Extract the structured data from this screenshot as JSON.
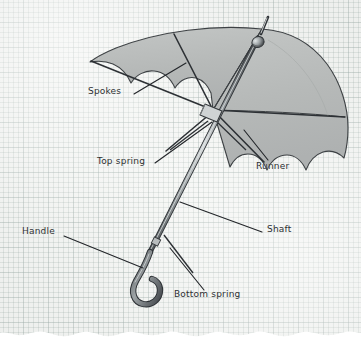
{
  "diagram": {
    "background": "graph-paper",
    "background_color": "#f6f7f5",
    "grid_color": "#a8b4b2",
    "canopy_fill": "#b9bcbb",
    "canopy_stroke": "#3d4144",
    "metal_color": "#6f7376",
    "line_color": "#23262a",
    "label_color": "#2c2f31"
  },
  "labels": [
    {
      "id": "spokes",
      "text": "Spokes",
      "x": 88,
      "y": 93
    },
    {
      "id": "top-spring",
      "text": "Top spring",
      "x": 97,
      "y": 163
    },
    {
      "id": "runner",
      "text": "Runner",
      "x": 256,
      "y": 168
    },
    {
      "id": "shaft",
      "text": "Shaft",
      "x": 267,
      "y": 231
    },
    {
      "id": "handle",
      "text": "Handle",
      "x": 22,
      "y": 233
    },
    {
      "id": "bottom-spring",
      "text": "Bottom spring",
      "x": 174,
      "y": 296
    }
  ],
  "leader_lines": [
    {
      "id": "spokes-leader",
      "x1": 134,
      "y1": 94,
      "x2": 186,
      "y2": 63
    },
    {
      "id": "top-spring-leader",
      "x1": 155,
      "y1": 163,
      "x2": 212,
      "y2": 122
    },
    {
      "id": "runner-leader",
      "x1": 268,
      "y1": 160,
      "x2": 244,
      "y2": 130
    },
    {
      "id": "shaft-leader",
      "x1": 262,
      "y1": 232,
      "x2": 180,
      "y2": 202
    },
    {
      "id": "handle-leader",
      "x1": 64,
      "y1": 236,
      "x2": 143,
      "y2": 268
    },
    {
      "id": "bottom-spring-leader",
      "x1": 204,
      "y1": 290,
      "x2": 170,
      "y2": 248
    }
  ],
  "parts": [
    {
      "id": "canopy",
      "name": "umbrella-canopy"
    },
    {
      "id": "ferrule",
      "name": "umbrella-tip-ferrule"
    },
    {
      "id": "shaft",
      "name": "umbrella-shaft"
    },
    {
      "id": "runner",
      "name": "umbrella-runner-collar"
    },
    {
      "id": "spoke-rib",
      "name": "umbrella-spoke-rib"
    },
    {
      "id": "top-spring",
      "name": "umbrella-top-spring"
    },
    {
      "id": "bottom-spring",
      "name": "umbrella-bottom-spring"
    },
    {
      "id": "handle",
      "name": "umbrella-handle-hook"
    }
  ]
}
